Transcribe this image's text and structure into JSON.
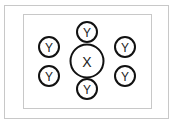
{
  "diagram": {
    "center_node": {
      "label": "X"
    },
    "satellite_nodes": [
      {
        "label": "Y",
        "position": "top"
      },
      {
        "label": "Y",
        "position": "bottom"
      },
      {
        "label": "Y",
        "position": "left-upper"
      },
      {
        "label": "Y",
        "position": "left-lower"
      },
      {
        "label": "Y",
        "position": "right-upper"
      },
      {
        "label": "Y",
        "position": "right-lower"
      }
    ],
    "colors": {
      "stroke": "#111111",
      "frame": "#c8c8c8",
      "background": "#ffffff"
    }
  }
}
